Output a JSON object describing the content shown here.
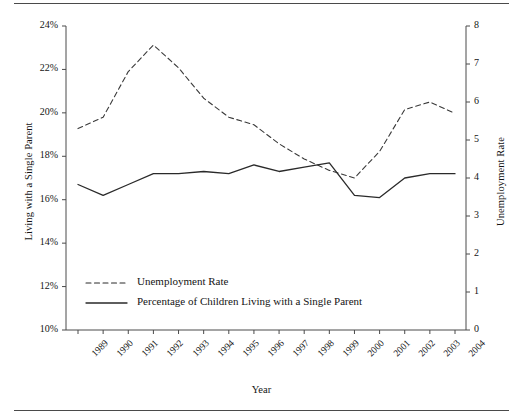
{
  "figure": {
    "xlabel": "Year",
    "ylabel_left": "Living with a Single Parent",
    "ylabel_right": "Unemployment Rate"
  },
  "legend": {
    "items": [
      {
        "label": "Unemployment Rate",
        "style": "dashed"
      },
      {
        "label": "Percentage of Children Living with a Single Parent",
        "style": "solid"
      }
    ]
  },
  "axes": {
    "y_left_ticks": [
      "10%",
      "12%",
      "14%",
      "16%",
      "18%",
      "20%",
      "22%",
      "24%"
    ],
    "y_right_ticks": [
      "0",
      "1",
      "2",
      "3",
      "4",
      "5",
      "6",
      "7",
      "8"
    ],
    "x_ticks": [
      "1989",
      "1990",
      "1991",
      "1992",
      "1993",
      "1994",
      "1995",
      "1996",
      "1997",
      "1998",
      "1999",
      "2000",
      "2001",
      "2002",
      "2003",
      "2004"
    ]
  },
  "chart_data": {
    "type": "line",
    "title": "",
    "xlabel": "Year",
    "ylabel": "Living with a Single Parent",
    "ylabel_secondary": "Unemployment Rate",
    "categories": [
      "1989",
      "1990",
      "1991",
      "1992",
      "1993",
      "1994",
      "1995",
      "1996",
      "1997",
      "1998",
      "1999",
      "2000",
      "2001",
      "2002",
      "2003",
      "2004"
    ],
    "ylim": [
      10,
      24
    ],
    "ylim_secondary": [
      0,
      8
    ],
    "grid": false,
    "legend_position": "center-left",
    "series": [
      {
        "name": "Unemployment Rate",
        "axis": "secondary",
        "style": "dashed",
        "color": "#3a3a3a",
        "values": [
          5.3,
          5.6,
          6.8,
          7.5,
          6.9,
          6.1,
          5.6,
          5.4,
          4.9,
          4.5,
          4.2,
          4.0,
          4.7,
          5.8,
          6.0,
          5.7
        ]
      },
      {
        "name": "Percentage of Children Living with a Single Parent",
        "axis": "primary",
        "style": "solid",
        "color": "#2a2a2a",
        "values": [
          16.7,
          16.2,
          16.7,
          17.2,
          17.2,
          17.3,
          17.2,
          17.6,
          17.3,
          17.5,
          17.7,
          16.2,
          16.1,
          17.0,
          17.2,
          17.2
        ]
      }
    ]
  }
}
